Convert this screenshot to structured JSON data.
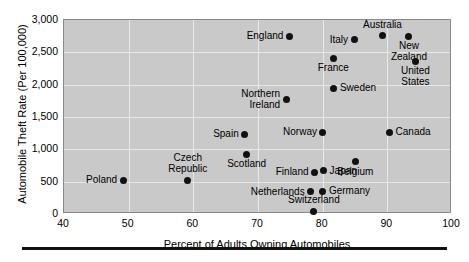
{
  "chart_data": {
    "type": "scatter",
    "title": "",
    "xlabel": "Percent of Adults Owning Automobiles",
    "ylabel": "Automobile Theft Rate (Per 100,000)",
    "xlim": [
      40,
      100
    ],
    "ylim": [
      0,
      3000
    ],
    "xticks": [
      "40",
      "50",
      "60",
      "70",
      "80",
      "90",
      "100"
    ],
    "yticks": [
      "0",
      "500",
      "1,000",
      "1,500",
      "2,000",
      "2,500",
      "3,000"
    ],
    "grid": true,
    "legend": "none",
    "point_color": "#111111",
    "plot_background": "#c9c9c9",
    "points": [
      {
        "label": "Poland",
        "x": 49.3,
        "y": 510,
        "placement": "left"
      },
      {
        "label": "Czech\nRepublic",
        "x": 59.3,
        "y": 510,
        "placement": "above"
      },
      {
        "label": "Scotland",
        "x": 68.4,
        "y": 910,
        "placement": "below"
      },
      {
        "label": "Spain",
        "x": 68.1,
        "y": 1215,
        "placement": "left"
      },
      {
        "label": "Northern\nIreland",
        "x": 74.5,
        "y": 1760,
        "placement": "left"
      },
      {
        "label": "England",
        "x": 75.0,
        "y": 2730,
        "placement": "left"
      },
      {
        "label": "Netherlands",
        "x": 78.3,
        "y": 330,
        "placement": "left"
      },
      {
        "label": "Switzerland",
        "x": 78.8,
        "y": 30,
        "placement": "above"
      },
      {
        "label": "Finland",
        "x": 78.9,
        "y": 630,
        "placement": "left"
      },
      {
        "label": "Germany",
        "x": 80.2,
        "y": 335,
        "placement": "right"
      },
      {
        "label": "Norway",
        "x": 80.2,
        "y": 1245,
        "placement": "left"
      },
      {
        "label": "Japan",
        "x": 80.3,
        "y": 650,
        "placement": "right"
      },
      {
        "label": "France",
        "x": 81.8,
        "y": 2390,
        "placement": "below"
      },
      {
        "label": "Sweden",
        "x": 81.9,
        "y": 1930,
        "placement": "right"
      },
      {
        "label": "Italy",
        "x": 85.0,
        "y": 2680,
        "placement": "left"
      },
      {
        "label": "Belgium",
        "x": 85.2,
        "y": 790,
        "placement": "below"
      },
      {
        "label": "Australia",
        "x": 89.4,
        "y": 2740,
        "placement": "above"
      },
      {
        "label": "Canada",
        "x": 90.5,
        "y": 1245,
        "placement": "right"
      },
      {
        "label": "New\nZealand",
        "x": 93.5,
        "y": 2735,
        "placement": "below"
      },
      {
        "label": "United\nStates",
        "x": 94.5,
        "y": 2345,
        "placement": "below"
      }
    ]
  }
}
